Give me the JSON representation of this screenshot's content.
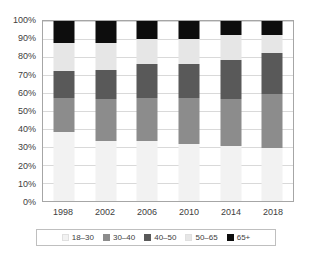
{
  "chart_data": {
    "type": "bar",
    "stacked": true,
    "normalized": "100%",
    "title": "",
    "subtitle": "",
    "xlabel": "",
    "ylabel": "",
    "categories": [
      "1998",
      "2002",
      "2006",
      "2010",
      "2014",
      "2018"
    ],
    "ylim": [
      0,
      100
    ],
    "ytick_labels": [
      "0%",
      "10%",
      "20%",
      "30%",
      "40%",
      "50%",
      "60%",
      "70%",
      "80%",
      "90%",
      "100%"
    ],
    "ytick_values": [
      0,
      10,
      20,
      30,
      40,
      50,
      60,
      70,
      80,
      90,
      100
    ],
    "grid": true,
    "legend_position": "bottom",
    "series": [
      {
        "name": "18–30",
        "color": "#f2f2f2",
        "values": [
          38.5,
          33.5,
          33.5,
          31.5,
          30.5,
          29.5
        ]
      },
      {
        "name": "30–40",
        "color": "#8c8c8c",
        "values": [
          19.0,
          23.0,
          24.0,
          25.5,
          26.0,
          30.0
        ]
      },
      {
        "name": "40–50",
        "color": "#595959",
        "values": [
          15.0,
          16.5,
          18.5,
          19.0,
          22.0,
          22.5
        ]
      },
      {
        "name": "50–65",
        "color": "#e6e6e6",
        "values": [
          15.5,
          15.0,
          14.0,
          14.0,
          13.5,
          10.0
        ]
      },
      {
        "name": "65+",
        "color": "#0d0d0d",
        "values": [
          12.0,
          12.0,
          10.0,
          10.0,
          8.0,
          8.0
        ]
      }
    ]
  },
  "legend": {
    "items": [
      {
        "label": "18–30"
      },
      {
        "label": "30–40"
      },
      {
        "label": "40–50"
      },
      {
        "label": "50–65"
      },
      {
        "label": "65+"
      }
    ]
  },
  "colors": {
    "plot_border": "#a6a6a6",
    "gridline": "#d9d9d9",
    "legend_border": "#bfbfbf",
    "text": "#404040",
    "background": "#ffffff"
  }
}
